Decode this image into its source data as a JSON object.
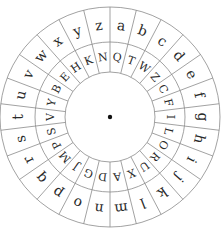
{
  "wheel": {
    "title": "Cipher wheel",
    "center": {
      "x": 110,
      "y": 117
    },
    "radii": {
      "outer": 110,
      "middle": 75,
      "inner": 45
    },
    "center_dot_color": "#111111",
    "line_color": "#8a8a8a",
    "outer_ring": [
      "a",
      "b",
      "c",
      "d",
      "e",
      "f",
      "g",
      "h",
      "i",
      "j",
      "k",
      "l",
      "m",
      "n",
      "o",
      "p",
      "q",
      "r",
      "s",
      "t",
      "u",
      "v",
      "w",
      "x",
      "y",
      "z"
    ],
    "inner_ring": [
      "Q",
      "T",
      "W",
      "Z",
      "C",
      "F",
      "I",
      "L",
      "O",
      "R",
      "U",
      "X",
      "A",
      "D",
      "G",
      "J",
      "M",
      "P",
      "S",
      "V",
      "Y",
      "B",
      "E",
      "H",
      "K",
      "N"
    ]
  }
}
